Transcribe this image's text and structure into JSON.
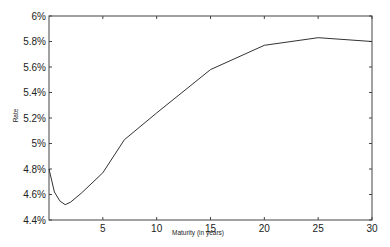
{
  "chart_data": {
    "type": "line",
    "title": "",
    "xlabel": "Maturity (in years)",
    "ylabel": "Rate",
    "xlim": [
      0,
      30
    ],
    "ylim": [
      4.4,
      6.0
    ],
    "x_ticks": [
      "5",
      "10",
      "15",
      "20",
      "25",
      "30"
    ],
    "y_ticks": [
      "4.4%",
      "4.6%",
      "4.8%",
      "5%",
      "5.2%",
      "5.4%",
      "5.6%",
      "5.8%",
      "6%"
    ],
    "grid": false,
    "series": [
      {
        "name": "Yield curve",
        "x": [
          0,
          0.5,
          1,
          1.5,
          2,
          3,
          5,
          7,
          10,
          15,
          20,
          25,
          30
        ],
        "values": [
          4.8,
          4.62,
          4.55,
          4.52,
          4.54,
          4.61,
          4.77,
          5.03,
          5.24,
          5.58,
          5.77,
          5.83,
          5.8
        ]
      }
    ]
  }
}
